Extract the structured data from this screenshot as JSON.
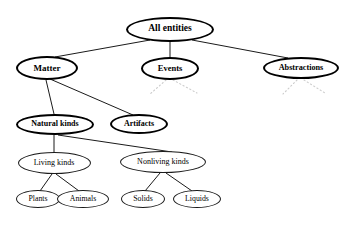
{
  "diagram": {
    "background_color": "#ffffff",
    "line_color": "#000000",
    "dotted_edge_color": "#cccccc",
    "nodes": [
      {
        "id": "all_entities",
        "label": "All entities",
        "x": 170,
        "y": 29,
        "w": 88,
        "h": 25,
        "style": "bold",
        "font_size": 9.5
      },
      {
        "id": "matter",
        "label": "Matter",
        "x": 47,
        "y": 68,
        "w": 62,
        "h": 24,
        "style": "bold",
        "font_size": 9.0
      },
      {
        "id": "events",
        "label": "Events",
        "x": 170,
        "y": 68,
        "w": 58,
        "h": 23,
        "style": "bold",
        "font_size": 8.5
      },
      {
        "id": "abstractions",
        "label": "Abstractions",
        "x": 301,
        "y": 68,
        "w": 76,
        "h": 22,
        "style": "bold",
        "font_size": 8.2
      },
      {
        "id": "natural_kinds",
        "label": "Natural kinds",
        "x": 55,
        "y": 124,
        "w": 78,
        "h": 21,
        "style": "bold",
        "font_size": 8.0
      },
      {
        "id": "artifacts",
        "label": "Artifacts",
        "x": 139,
        "y": 124,
        "w": 58,
        "h": 20,
        "style": "bold",
        "font_size": 8.0
      },
      {
        "id": "living_kinds",
        "label": "Living kinds",
        "x": 54,
        "y": 163,
        "w": 73,
        "h": 22,
        "style": "thin",
        "font_size": 8.0
      },
      {
        "id": "nonliving_kinds",
        "label": "Nonliving kinds",
        "x": 163,
        "y": 162,
        "w": 86,
        "h": 22,
        "style": "thin",
        "font_size": 8.0
      },
      {
        "id": "plants",
        "label": "Plants",
        "x": 38,
        "y": 199,
        "w": 44,
        "h": 18,
        "style": "thin",
        "font_size": 7.8
      },
      {
        "id": "animals",
        "label": "Animals",
        "x": 83,
        "y": 199,
        "w": 52,
        "h": 18,
        "style": "thin",
        "font_size": 7.8
      },
      {
        "id": "solids",
        "label": "Solids",
        "x": 143,
        "y": 199,
        "w": 44,
        "h": 18,
        "style": "thin",
        "font_size": 7.8
      },
      {
        "id": "liquids",
        "label": "Liquids",
        "x": 197,
        "y": 199,
        "w": 48,
        "h": 18,
        "style": "thin",
        "font_size": 7.8
      }
    ],
    "edges": [
      {
        "from": "all_entities",
        "to": "matter",
        "x1": 150,
        "y1": 40,
        "x2": 55,
        "y2": 57,
        "style": "solid"
      },
      {
        "from": "all_entities",
        "to": "events",
        "x1": 170,
        "y1": 42,
        "x2": 170,
        "y2": 57,
        "style": "solid"
      },
      {
        "from": "all_entities",
        "to": "abstractions",
        "x1": 192,
        "y1": 40,
        "x2": 288,
        "y2": 58,
        "style": "solid"
      },
      {
        "from": "matter",
        "to": "natural_kinds",
        "x1": 46,
        "y1": 80,
        "x2": 54,
        "y2": 114,
        "style": "solid"
      },
      {
        "from": "matter",
        "to": "artifacts",
        "x1": 50,
        "y1": 79,
        "x2": 133,
        "y2": 115,
        "style": "solid"
      },
      {
        "from": "natural_kinds",
        "to": "living_kinds",
        "x1": 54,
        "y1": 135,
        "x2": 54,
        "y2": 152,
        "style": "solid"
      },
      {
        "from": "natural_kinds",
        "to": "nonliving_kinds",
        "x1": 58,
        "y1": 135,
        "x2": 172,
        "y2": 152,
        "style": "solid"
      },
      {
        "from": "living_kinds",
        "to": "plants",
        "x1": 52,
        "y1": 174,
        "x2": 40,
        "y2": 191,
        "style": "solid"
      },
      {
        "from": "living_kinds",
        "to": "animals",
        "x1": 56,
        "y1": 174,
        "x2": 79,
        "y2": 191,
        "style": "solid"
      },
      {
        "from": "nonliving_kinds",
        "to": "solids",
        "x1": 160,
        "y1": 173,
        "x2": 145,
        "y2": 191,
        "style": "solid"
      },
      {
        "from": "nonliving_kinds",
        "to": "liquids",
        "x1": 166,
        "y1": 173,
        "x2": 192,
        "y2": 191,
        "style": "solid"
      },
      {
        "from": "events",
        "to": "unspecified-left",
        "x1": 166,
        "y1": 80,
        "x2": 150,
        "y2": 94,
        "style": "dotted"
      },
      {
        "from": "events",
        "to": "unspecified-right",
        "x1": 173,
        "y1": 80,
        "x2": 197,
        "y2": 93,
        "style": "dotted"
      },
      {
        "from": "abstractions",
        "to": "unspecified-left",
        "x1": 297,
        "y1": 80,
        "x2": 283,
        "y2": 94,
        "style": "dotted"
      },
      {
        "from": "abstractions",
        "to": "unspecified-right",
        "x1": 304,
        "y1": 80,
        "x2": 325,
        "y2": 93,
        "style": "dotted"
      }
    ]
  }
}
